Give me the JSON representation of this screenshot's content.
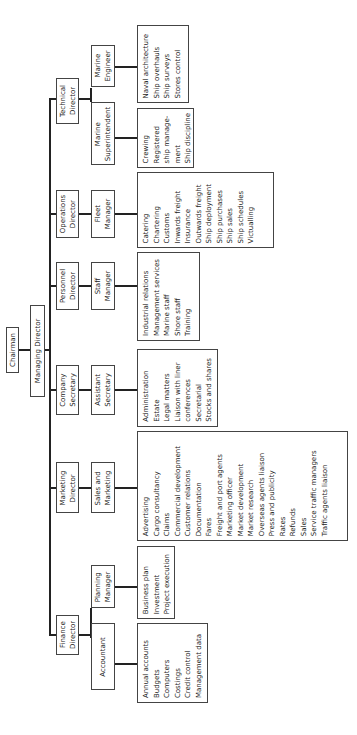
{
  "chairman": "Chairman",
  "managing_director": "Managing Director",
  "directors": [
    {
      "name": "Technical\nDirector",
      "reports": [
        {
          "name": "Marine\nEngineer",
          "duties": [
            "Naval architecture",
            "Ship overhauls",
            "Ship surveys",
            "Stores control"
          ]
        },
        {
          "name": "Marine\nSuperintendent",
          "duties": [
            "Crewing",
            "Registered",
            "ship manage-",
            "ment",
            "Ship discipline"
          ]
        }
      ]
    },
    {
      "name": "Operations\nDirector",
      "reports": [
        {
          "name": "Fleet\nManager",
          "duties": [
            "Catering",
            "Chartering",
            "Customs",
            "Inwards freight",
            "Insurance",
            "Outwards freight",
            "Ship deployment",
            "Ship purchases",
            "Ship sales",
            "Ship schedules",
            "Victualling"
          ]
        }
      ]
    },
    {
      "name": "Personnel\nDirector",
      "reports": [
        {
          "name": "Staff\nManager",
          "duties": [
            "Industrial relations",
            "Management services",
            "Marine staff",
            "Shore staff",
            "Training"
          ]
        }
      ]
    },
    {
      "name": "Company\nSecretary",
      "reports": [
        {
          "name": "Assistant\nSecretary",
          "duties": [
            "Administration",
            "Estate",
            "Legal matters",
            "Liaison with liner",
            "conferences",
            "Secretarial",
            "Stocks and shares"
          ]
        }
      ]
    },
    {
      "name": "Marketing\nDirector",
      "reports": [
        {
          "name": "Sales and\nMarketing",
          "duties": [
            "Advertising",
            "Cargo consultancy",
            "Claims",
            "Commercial development",
            "Customer relations",
            "Documentation",
            "Fares",
            "Freight and port agents",
            "Marketing officer",
            "Market development",
            "Market research",
            "Overseas agents liaison",
            "Press and publicity",
            "Rates",
            "Refunds",
            "Sales",
            "Service traffic managers",
            "Traffic agents liaison"
          ]
        }
      ]
    },
    {
      "name": "Finance\nDirector",
      "reports": [
        {
          "name": "Planning\nManager",
          "duties": [
            "Business plan",
            "Investment",
            "Project execution"
          ]
        },
        {
          "name": "Accountant",
          "duties": [
            "Annual accounts",
            "Budgets",
            "Computers",
            "Costings",
            "Credit control",
            "Management data"
          ]
        }
      ]
    }
  ],
  "colors": {
    "line": "#222222",
    "border": "#444444",
    "background": "#ffffff",
    "text": "#222222"
  }
}
